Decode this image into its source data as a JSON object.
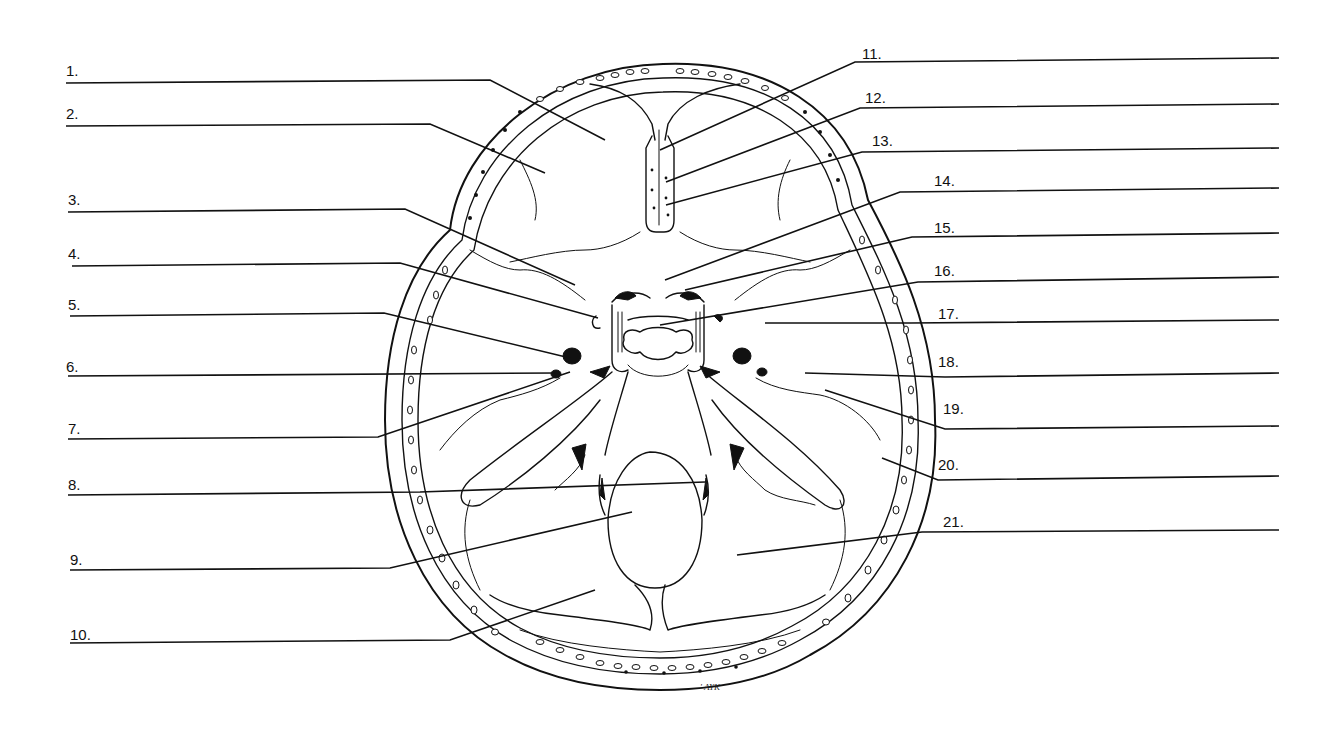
{
  "diagram": {
    "type": "anatomical-labeling-worksheet",
    "signature": "' AYK",
    "colors": {
      "ink": "#111111",
      "paper": "#ffffff"
    }
  },
  "labels_left": [
    {
      "id": 1,
      "text": "1.",
      "tx": 66,
      "ty": 76,
      "line": [
        [
          66,
          83
        ],
        [
          490,
          80
        ],
        [
          605,
          140
        ]
      ]
    },
    {
      "id": 2,
      "text": "2.",
      "tx": 66,
      "ty": 119,
      "line": [
        [
          66,
          126
        ],
        [
          430,
          124
        ],
        [
          545,
          173
        ]
      ]
    },
    {
      "id": 3,
      "text": "3.",
      "tx": 68,
      "ty": 205,
      "line": [
        [
          68,
          212
        ],
        [
          405,
          209
        ],
        [
          575,
          285
        ]
      ]
    },
    {
      "id": 4,
      "text": "4.",
      "tx": 68,
      "ty": 259,
      "line": [
        [
          72,
          266
        ],
        [
          400,
          263
        ],
        [
          598,
          318
        ]
      ]
    },
    {
      "id": 5,
      "text": "5.",
      "tx": 68,
      "ty": 310,
      "line": [
        [
          70,
          316
        ],
        [
          384,
          313
        ],
        [
          570,
          358
        ]
      ]
    },
    {
      "id": 6,
      "text": "6.",
      "tx": 66,
      "ty": 372,
      "line": [
        [
          68,
          376
        ],
        [
          555,
          373
        ]
      ]
    },
    {
      "id": 7,
      "text": "7.",
      "tx": 68,
      "ty": 434,
      "line": [
        [
          68,
          439
        ],
        [
          378,
          437
        ],
        [
          570,
          372
        ]
      ]
    },
    {
      "id": 8,
      "text": "8.",
      "tx": 68,
      "ty": 490,
      "line": [
        [
          68,
          495
        ],
        [
          420,
          492
        ],
        [
          705,
          482
        ]
      ]
    },
    {
      "id": 9,
      "text": "9.",
      "tx": 70,
      "ty": 565,
      "line": [
        [
          70,
          570
        ],
        [
          390,
          568
        ],
        [
          632,
          512
        ]
      ]
    },
    {
      "id": 10,
      "text": "10.",
      "tx": 70,
      "ty": 640,
      "line": [
        [
          70,
          643
        ],
        [
          450,
          640
        ],
        [
          595,
          590
        ]
      ]
    }
  ],
  "labels_right": [
    {
      "id": 11,
      "text": "11.",
      "tx": 862,
      "ty": 59,
      "line": [
        [
          1279,
          58
        ],
        [
          855,
          62
        ],
        [
          660,
          150
        ]
      ]
    },
    {
      "id": 12,
      "text": "12.",
      "tx": 865,
      "ty": 103,
      "line": [
        [
          1279,
          104
        ],
        [
          860,
          108
        ],
        [
          666,
          182
        ]
      ]
    },
    {
      "id": 13,
      "text": "13.",
      "tx": 872,
      "ty": 146,
      "line": [
        [
          1279,
          148
        ],
        [
          862,
          152
        ],
        [
          666,
          205
        ]
      ]
    },
    {
      "id": 14,
      "text": "14.",
      "tx": 934,
      "ty": 186,
      "line": [
        [
          1279,
          188
        ],
        [
          900,
          192
        ],
        [
          665,
          280
        ]
      ]
    },
    {
      "id": 15,
      "text": "15.",
      "tx": 934,
      "ty": 233,
      "line": [
        [
          1279,
          233
        ],
        [
          912,
          237
        ],
        [
          685,
          290
        ]
      ]
    },
    {
      "id": 16,
      "text": "16.",
      "tx": 934,
      "ty": 276,
      "line": [
        [
          1279,
          277
        ],
        [
          918,
          282
        ],
        [
          660,
          325
        ]
      ]
    },
    {
      "id": 17,
      "text": "17.",
      "tx": 938,
      "ty": 319,
      "line": [
        [
          1279,
          320
        ],
        [
          910,
          323
        ],
        [
          765,
          323
        ]
      ]
    },
    {
      "id": 18,
      "text": "18.",
      "tx": 938,
      "ty": 367,
      "line": [
        [
          1279,
          373
        ],
        [
          945,
          377
        ],
        [
          805,
          373
        ]
      ]
    },
    {
      "id": 19,
      "text": "19.",
      "tx": 943,
      "ty": 414,
      "line": [
        [
          1279,
          426
        ],
        [
          945,
          429
        ],
        [
          825,
          390
        ]
      ]
    },
    {
      "id": 20,
      "text": "20.",
      "tx": 938,
      "ty": 470,
      "line": [
        [
          1279,
          476
        ],
        [
          938,
          480
        ],
        [
          882,
          458
        ]
      ]
    },
    {
      "id": 21,
      "text": "21.",
      "tx": 943,
      "ty": 527,
      "line": [
        [
          1279,
          530
        ],
        [
          922,
          532
        ],
        [
          737,
          555
        ]
      ]
    }
  ]
}
